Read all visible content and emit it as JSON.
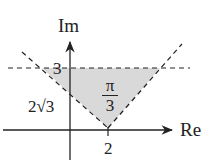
{
  "diagram": {
    "axes": {
      "x_label": "Re",
      "y_label": "Im"
    },
    "labels": {
      "y_tick_3": "3",
      "y_intercept": "2√3",
      "x_tick_2": "2",
      "angle_numerator": "π",
      "angle_denominator": "3"
    },
    "colors": {
      "shade": "#d9d9d9",
      "line": "#222222"
    }
  }
}
